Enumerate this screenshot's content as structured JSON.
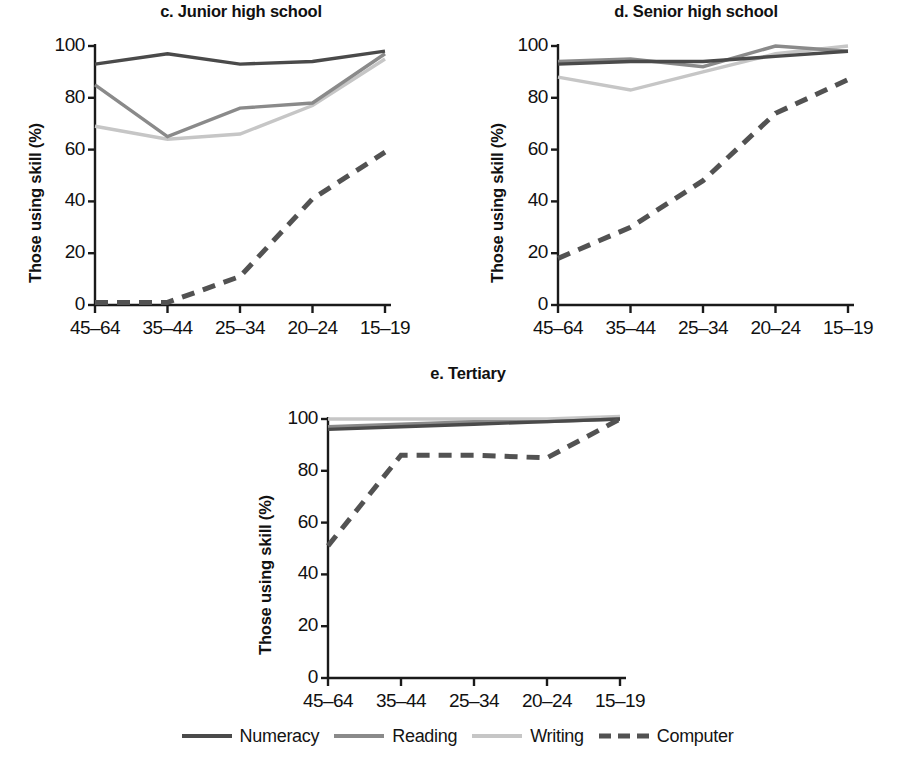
{
  "figure": {
    "ylabel": "Those using skill (%)",
    "y_ticks": [
      "0",
      "20",
      "40",
      "60",
      "80",
      "100"
    ],
    "x_ticks": [
      "45–64",
      "35–44",
      "25–34",
      "20–24",
      "15–19"
    ],
    "legend": [
      {
        "label": "Numeracy",
        "color": "#4a4a4a",
        "style": "solid"
      },
      {
        "label": "Reading",
        "color": "#8a8a8a",
        "style": "solid"
      },
      {
        "label": "Writing",
        "color": "#c6c6c6",
        "style": "solid"
      },
      {
        "label": "Computer",
        "color": "#525252",
        "style": "dashed"
      }
    ]
  },
  "panels": {
    "c": {
      "title": "c. Junior high school"
    },
    "d": {
      "title": "d. Senior high school"
    },
    "e": {
      "title": "e. Tertiary"
    }
  },
  "chart_data": [
    {
      "id": "c",
      "type": "line",
      "title": "c. Junior high school",
      "xlabel": "",
      "ylabel": "Those using skill (%)",
      "categories": [
        "45–64",
        "35–44",
        "25–34",
        "20–24",
        "15–19"
      ],
      "ylim": [
        0,
        100
      ],
      "yticks": [
        0,
        20,
        40,
        60,
        80,
        100
      ],
      "grid": false,
      "legend_position": "bottom-figure",
      "series": [
        {
          "name": "Numeracy",
          "color": "#4a4a4a",
          "style": "solid",
          "values": [
            93,
            97,
            93,
            94,
            98
          ]
        },
        {
          "name": "Reading",
          "color": "#8a8a8a",
          "style": "solid",
          "values": [
            85,
            65,
            76,
            78,
            97
          ]
        },
        {
          "name": "Writing",
          "color": "#c6c6c6",
          "style": "solid",
          "values": [
            69,
            64,
            66,
            77,
            95
          ]
        },
        {
          "name": "Computer",
          "color": "#525252",
          "style": "dashed",
          "values": [
            1,
            1,
            11,
            41,
            59
          ]
        }
      ]
    },
    {
      "id": "d",
      "type": "line",
      "title": "d. Senior high school",
      "xlabel": "",
      "ylabel": "Those using skill (%)",
      "categories": [
        "45–64",
        "35–44",
        "25–34",
        "20–24",
        "15–19"
      ],
      "ylim": [
        0,
        100
      ],
      "yticks": [
        0,
        20,
        40,
        60,
        80,
        100
      ],
      "grid": false,
      "legend_position": "bottom-figure",
      "series": [
        {
          "name": "Numeracy",
          "color": "#4a4a4a",
          "style": "solid",
          "values": [
            93,
            94,
            94,
            96,
            98
          ]
        },
        {
          "name": "Reading",
          "color": "#8a8a8a",
          "style": "solid",
          "values": [
            94,
            95,
            92,
            100,
            98
          ]
        },
        {
          "name": "Writing",
          "color": "#c6c6c6",
          "style": "solid",
          "values": [
            88,
            83,
            90,
            97,
            100
          ]
        },
        {
          "name": "Computer",
          "color": "#525252",
          "style": "dashed",
          "values": [
            18,
            30,
            48,
            74,
            87
          ]
        }
      ]
    },
    {
      "id": "e",
      "type": "line",
      "title": "e. Tertiary",
      "xlabel": "",
      "ylabel": "Those using skill (%)",
      "categories": [
        "45–64",
        "35–44",
        "25–34",
        "20–24",
        "15–19"
      ],
      "ylim": [
        0,
        100
      ],
      "yticks": [
        0,
        20,
        40,
        60,
        80,
        100
      ],
      "grid": false,
      "legend_position": "bottom-figure",
      "series": [
        {
          "name": "Numeracy",
          "color": "#4a4a4a",
          "style": "solid",
          "values": [
            96,
            97,
            98,
            99,
            100
          ]
        },
        {
          "name": "Reading",
          "color": "#8a8a8a",
          "style": "solid",
          "values": [
            97,
            98,
            99,
            99,
            100
          ]
        },
        {
          "name": "Writing",
          "color": "#c6c6c6",
          "style": "solid",
          "values": [
            100,
            100,
            100,
            100,
            101
          ]
        },
        {
          "name": "Computer",
          "color": "#525252",
          "style": "dashed",
          "values": [
            51,
            86,
            86,
            85,
            100
          ]
        }
      ]
    }
  ]
}
